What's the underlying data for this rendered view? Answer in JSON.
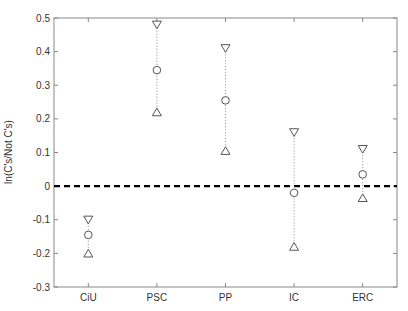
{
  "chart_data": {
    "type": "scatter",
    "title": "",
    "xlabel": "",
    "ylabel": "ln(C's/Not C's)",
    "categories": [
      "CiU",
      "PSC",
      "PP",
      "IC",
      "ERC"
    ],
    "series": [
      {
        "name": "upper",
        "marker": "triangle-down",
        "values": [
          -0.1,
          0.48,
          0.41,
          0.16,
          0.11
        ]
      },
      {
        "name": "estimate",
        "marker": "circle",
        "values": [
          -0.145,
          0.345,
          0.255,
          -0.02,
          0.035
        ]
      },
      {
        "name": "lower",
        "marker": "triangle-up",
        "values": [
          -0.2,
          0.22,
          0.105,
          -0.18,
          -0.035
        ]
      }
    ],
    "ylim": [
      -0.3,
      0.5
    ],
    "xlim": [
      0.5,
      5.5
    ],
    "yticks": [
      -0.3,
      -0.2,
      -0.1,
      0,
      0.1,
      0.2,
      0.3,
      0.4,
      0.5
    ],
    "ytick_labels": [
      "-0.3",
      "-0.2",
      "-0.1",
      "0",
      "0.1",
      "0.2",
      "0.3",
      "0.4",
      "0.5"
    ],
    "reference_line": {
      "y": 0,
      "style": "dashed",
      "color": "#000000"
    },
    "error_bar_style": "dotted",
    "grid": false,
    "legend": null,
    "colors": {
      "axis": "#888888",
      "marker": "#555555",
      "text": "#333333",
      "refline": "#000000"
    }
  }
}
